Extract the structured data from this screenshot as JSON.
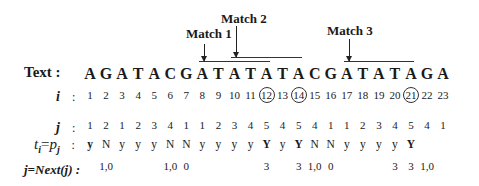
{
  "matches": [
    {
      "label": "Match 1",
      "start_index": 8,
      "end_index": 12
    },
    {
      "label": "Match 2",
      "start_index": 10,
      "end_index": 14
    },
    {
      "label": "Match 3",
      "start_index": 17,
      "end_index": 21
    }
  ],
  "rows": {
    "text": {
      "label": "Text :",
      "values": [
        "A",
        "G",
        "A",
        "T",
        "A",
        "C",
        "G",
        "A",
        "T",
        "A",
        "T",
        "A",
        "T",
        "A",
        "C",
        "G",
        "A",
        "T",
        "A",
        "T",
        "A",
        "G",
        "A"
      ]
    },
    "i": {
      "label": "i",
      "colon": ":",
      "values": [
        "1",
        "2",
        "3",
        "4",
        "5",
        "6",
        "7",
        "8",
        "9",
        "10",
        "11",
        "12",
        "13",
        "14",
        "15",
        "16",
        "17",
        "18",
        "19",
        "20",
        "21",
        "22",
        "23"
      ],
      "circled": [
        12,
        14,
        21
      ]
    },
    "j": {
      "label": "j",
      "colon": ":",
      "values": [
        "1",
        "2",
        "1",
        "2",
        "3",
        "4",
        "1",
        "1",
        "2",
        "3",
        "4",
        "5",
        "4",
        "5",
        "4",
        "1",
        "1",
        "2",
        "3",
        "4",
        "5",
        "4",
        "1"
      ]
    },
    "t_eq_p": {
      "label_t": "t",
      "label_i": "i",
      "label_eq": "=",
      "label_p": "p",
      "label_j": "j",
      "colon": ":",
      "values": [
        "y",
        "N",
        "y",
        "y",
        "y",
        "N",
        "N",
        "y",
        "y",
        "y",
        "y",
        "Y",
        "y",
        "Y",
        "N",
        "N",
        "y",
        "y",
        "y",
        "y",
        "Y",
        "",
        ""
      ],
      "bold": [
        1,
        12,
        14,
        21
      ]
    },
    "next": {
      "label": "j=Next(j) :",
      "values": [
        "",
        "1,0",
        "",
        "",
        "",
        "1,0",
        "0",
        "",
        "",
        "",
        "",
        "3",
        "",
        "3",
        "1,0",
        "0",
        "",
        "",
        "",
        "3",
        "3",
        "1,0",
        ""
      ]
    }
  }
}
